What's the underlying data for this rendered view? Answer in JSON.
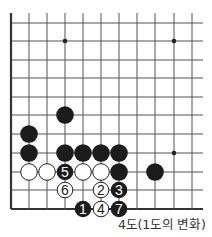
{
  "diagram": {
    "title": "4도(1도의 변화)",
    "board": {
      "columns_x": [
        11,
        29,
        47,
        65,
        83,
        101,
        119,
        137,
        155,
        174,
        192
      ],
      "rows_y": [
        23,
        41,
        60,
        78,
        97,
        115,
        134,
        153,
        172,
        190,
        209
      ],
      "top_start_y": 13,
      "right_end_x": 203,
      "edges": [
        "left",
        "bottom"
      ],
      "line_color": "#555555",
      "edge_color": "#333333"
    },
    "star_points": [
      {
        "col": 3,
        "row": 1
      },
      {
        "col": 9,
        "row": 1
      },
      {
        "col": 9,
        "row": 7
      }
    ],
    "stones": [
      {
        "color": "black",
        "col": 3,
        "row": 5,
        "label": ""
      },
      {
        "color": "black",
        "col": 1,
        "row": 6,
        "label": ""
      },
      {
        "color": "black",
        "col": 1,
        "row": 7,
        "label": ""
      },
      {
        "color": "black",
        "col": 3,
        "row": 7,
        "label": ""
      },
      {
        "color": "black",
        "col": 4,
        "row": 7,
        "label": ""
      },
      {
        "color": "black",
        "col": 5,
        "row": 7,
        "label": ""
      },
      {
        "color": "black",
        "col": 6,
        "row": 7,
        "label": ""
      },
      {
        "color": "white",
        "col": 1,
        "row": 8,
        "label": ""
      },
      {
        "color": "white",
        "col": 2,
        "row": 8,
        "label": ""
      },
      {
        "color": "black",
        "col": 3,
        "row": 8,
        "label": "5"
      },
      {
        "color": "white",
        "col": 4,
        "row": 8,
        "label": ""
      },
      {
        "color": "white",
        "col": 5,
        "row": 8,
        "label": ""
      },
      {
        "color": "black",
        "col": 6,
        "row": 8,
        "label": ""
      },
      {
        "color": "black",
        "col": 8,
        "row": 8,
        "label": ""
      },
      {
        "color": "white",
        "col": 3,
        "row": 9,
        "label": "6"
      },
      {
        "color": "white",
        "col": 5,
        "row": 9,
        "label": "2"
      },
      {
        "color": "black",
        "col": 6,
        "row": 9,
        "label": "3"
      },
      {
        "color": "black",
        "col": 4,
        "row": 10,
        "label": "1"
      },
      {
        "color": "white",
        "col": 5,
        "row": 10,
        "label": "4"
      },
      {
        "color": "black",
        "col": 6,
        "row": 10,
        "label": "7"
      }
    ],
    "colors": {
      "black_stone": "#1c1c1c",
      "white_stone": "#ffffff",
      "white_outline": "#222222",
      "label_on_black": "#ffffff",
      "label_on_white": "#222222"
    }
  }
}
